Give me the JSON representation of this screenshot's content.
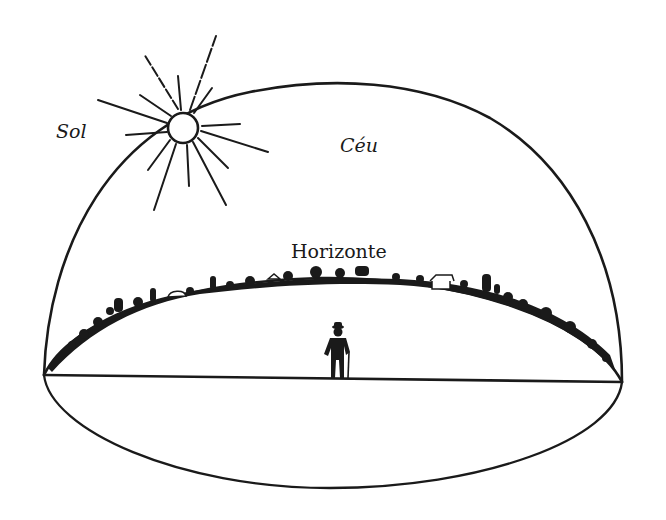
{
  "diagram": {
    "labels": {
      "sun": "Sol",
      "sky": "Céu",
      "horizon": "Horizonte"
    },
    "colors": {
      "ink": "#1a1a1a",
      "background": "#ffffff"
    },
    "elements": [
      "sun-with-rays",
      "celestial-dome",
      "horizon-ellipse",
      "horizon-skyline",
      "ground-plane-line",
      "observer-figure"
    ]
  }
}
